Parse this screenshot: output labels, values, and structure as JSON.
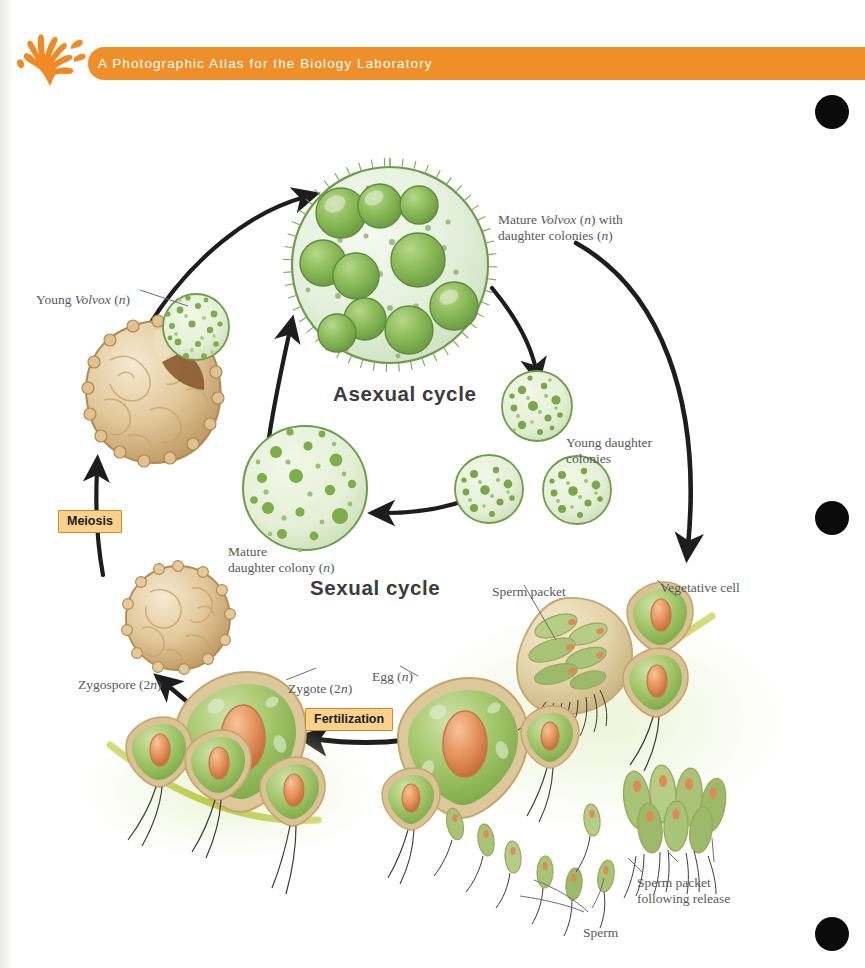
{
  "header": {
    "title": "A Photographic Atlas for the Biology Laboratory",
    "logo_icon": "coral-seaweed-logo",
    "band_color": "#ef8f2a",
    "title_color": "#ffffff"
  },
  "figure": {
    "headings": [
      {
        "text": "Asexual cycle",
        "x": 333,
        "y": 392
      },
      {
        "text": "Sexual cycle",
        "x": 310,
        "y": 585
      }
    ],
    "process_labels": [
      {
        "text": "Meiosis",
        "x": 58,
        "y": 510,
        "fill": "#fbd28c",
        "border": "#cf8a23"
      },
      {
        "text": "Fertilization",
        "x": 305,
        "y": 708,
        "fill": "#fbd28c",
        "border": "#cf8a23"
      }
    ],
    "labels": [
      {
        "id": "young-volvox",
        "text": "Young Volvox (n)",
        "html": "Young <i>Volvox</i> (<i>n</i>)",
        "x": 36,
        "y": 283
      },
      {
        "id": "mature-volvox",
        "text": "Mature Volvox (n) with daughter colonies (n)",
        "html": "Mature <i>Volvox</i> (<i>n</i>) with<br>daughter colonies (<i>n</i>)",
        "x": 498,
        "y": 203
      },
      {
        "id": "young-daughter-colonies",
        "text": "Young daughter colonies",
        "html": "Young daughter<br>colonies",
        "x": 566,
        "y": 426
      },
      {
        "id": "mature-daughter-colony",
        "text": "Mature daughter colony (n)",
        "html": "Mature<br>daughter colony (<i>n</i>)",
        "x": 228,
        "y": 535
      },
      {
        "id": "zygospore",
        "text": "Zygospore (2n)",
        "html": "Zygospore (2<i>n</i>)",
        "x": 78,
        "y": 668
      },
      {
        "id": "zygote",
        "text": "Zygote (2n)",
        "html": "Zygote (2<i>n</i>)",
        "x": 288,
        "y": 672
      },
      {
        "id": "egg",
        "text": "Egg (n)",
        "html": "Egg (<i>n</i>)",
        "x": 372,
        "y": 660
      },
      {
        "id": "sperm-packet",
        "text": "Sperm packet",
        "html": "Sperm packet",
        "x": 492,
        "y": 575
      },
      {
        "id": "vegetative-cell",
        "text": "Vegetative cell",
        "html": "Vegetative cell",
        "x": 660,
        "y": 571
      },
      {
        "id": "sperm-packet-following-release",
        "text": "Sperm packet following release",
        "html": "Sperm packet<br>following release",
        "x": 637,
        "y": 866
      },
      {
        "id": "sperm",
        "text": "Sperm",
        "html": "Sperm",
        "x": 583,
        "y": 916
      }
    ],
    "colors": {
      "volvox_body": "#e8f2e2",
      "volvox_rim": "#6f9c4a",
      "daughter_colony": "#7cae4a",
      "zygospore": "#e4c89a",
      "zygospore_shade": "#c19a62",
      "cell_green": "#9cc069",
      "cell_nucleus": "#e08a55",
      "cell_wall": "#d9c08c",
      "surface_band": "#c3d157",
      "arrow": "#1d1d1d"
    }
  },
  "registration_dots": [
    {
      "x": 832,
      "y": 112
    },
    {
      "x": 832,
      "y": 518
    },
    {
      "x": 832,
      "y": 934
    }
  ]
}
